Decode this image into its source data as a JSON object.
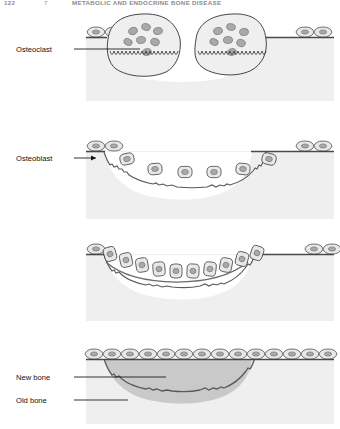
{
  "header": {
    "folio": "122",
    "chapter_mark": "7",
    "running_title": "METABOLIC AND ENDOCRINE BONE DISEASE"
  },
  "figure": {
    "caption_labels": {
      "osteoclast": "Osteoclast",
      "osteoblast": "Osteoblast",
      "new_bone": "New bone",
      "old_bone": "Old bone"
    }
  },
  "panels": [
    {
      "id": "panel-resorption",
      "stage": "resorption",
      "label": "Osteoclast",
      "osteoclast_count": 2,
      "nuclei_per_osteoclast": 7,
      "lining_cells_left": 2,
      "lining_cells_right": 2,
      "has_ruffled_border": true
    },
    {
      "id": "panel-reversal",
      "stage": "reversal",
      "label": "Osteoblast",
      "osteoblast_count": 6,
      "lining_cells_left": 2,
      "lining_cells_right": 2,
      "cavity_scalloped": true
    },
    {
      "id": "panel-formation",
      "stage": "formation",
      "label": "",
      "osteoblast_count": 10,
      "osteoid_seam": true
    },
    {
      "id": "panel-quiescence",
      "stage": "quiescence",
      "labels": [
        "New bone",
        "Old bone"
      ],
      "lining_cell_count": 14,
      "new_bone_filled": true
    }
  ],
  "colors": {
    "old_bone": "#efefef",
    "new_bone": "#c9c9c9",
    "cell_body": "#e8e8e8",
    "nucleus": "#a9a9a9",
    "outline": "#3a3a3a",
    "bone_surface_line": "#4a4a4a",
    "label_text": "#111111",
    "header_text": "#8a8a92",
    "page_background": "#ffffff"
  }
}
